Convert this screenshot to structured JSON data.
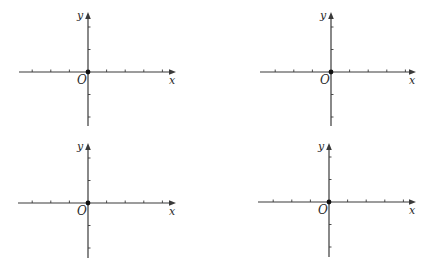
{
  "figure": {
    "axis_color": "#3a3a3a",
    "planes": [
      {
        "id": "top-left",
        "origin": [
          88,
          72
        ],
        "x_axis": {
          "start": 19,
          "end": 176,
          "label": "x"
        },
        "y_axis": {
          "top": 12,
          "bottom": 126,
          "label": "y"
        },
        "origin_label": "O",
        "x_tick_step": 18.6,
        "x_ticks_negative": 3,
        "x_ticks_positive": 4,
        "y_tick_step": 22.5,
        "y_ticks_positive": 2,
        "y_ticks_negative": 2
      },
      {
        "id": "top-right",
        "origin": [
          331,
          72
        ],
        "x_axis": {
          "start": 260,
          "end": 416,
          "label": "x"
        },
        "y_axis": {
          "top": 12,
          "bottom": 126,
          "label": "y"
        },
        "origin_label": "O",
        "x_tick_step": 18.6,
        "x_ticks_negative": 3,
        "x_ticks_positive": 4,
        "y_tick_step": 22.5,
        "y_ticks_positive": 2,
        "y_ticks_negative": 2
      },
      {
        "id": "bottom-left",
        "origin": [
          88,
          203
        ],
        "x_axis": {
          "start": 18,
          "end": 176,
          "label": "x"
        },
        "y_axis": {
          "top": 143,
          "bottom": 258,
          "label": "y"
        },
        "origin_label": "O",
        "x_tick_step": 18.6,
        "x_ticks_negative": 3,
        "x_ticks_positive": 4,
        "y_tick_step": 22.5,
        "y_ticks_positive": 2,
        "y_ticks_negative": 2
      },
      {
        "id": "bottom-right",
        "origin": [
          329,
          202
        ],
        "x_axis": {
          "start": 258,
          "end": 416,
          "label": "x"
        },
        "y_axis": {
          "top": 143,
          "bottom": 257,
          "label": "y"
        },
        "origin_label": "O",
        "x_tick_step": 18.6,
        "x_ticks_negative": 3,
        "x_ticks_positive": 4,
        "y_tick_step": 22.5,
        "y_ticks_positive": 2,
        "y_ticks_negative": 2
      }
    ]
  }
}
